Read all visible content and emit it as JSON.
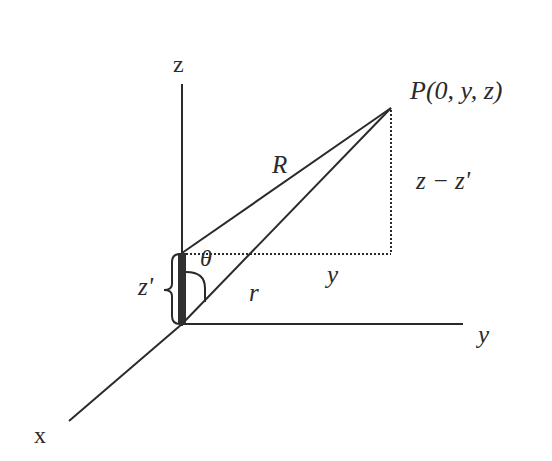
{
  "diagram": {
    "axes": {
      "z_label": "z",
      "y_label": "y",
      "x_label": "x"
    },
    "point_label": "P(0, y, z)",
    "segments": {
      "R_label": "R",
      "r_label": "r",
      "y_label": "y",
      "z_diff_label": "z − z'",
      "z_prime_label": "z'",
      "angle_label": "θ"
    },
    "colors": {
      "line": "#2a2a2a",
      "source_bar": "#303030",
      "background": "#ffffff"
    }
  }
}
